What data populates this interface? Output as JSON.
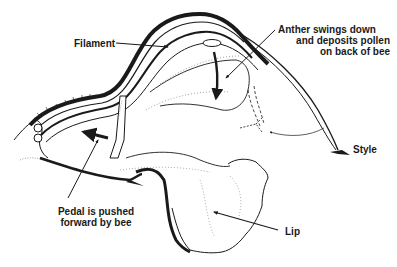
{
  "diagram": {
    "labels": {
      "filament": "Filament",
      "anther": [
        "Anther swings down",
        "and deposits pollen",
        "on back of bee"
      ],
      "style": "Style",
      "pedal": [
        "Pedal is pushed",
        "forward by bee"
      ],
      "lip": "Lip"
    },
    "colors": {
      "ink": "#1a1a1a",
      "stipple": "#8a8a8a",
      "background": "#ffffff"
    }
  }
}
